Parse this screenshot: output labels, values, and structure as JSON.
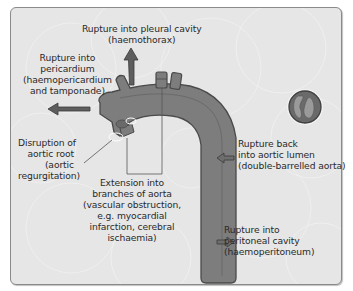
{
  "diagram": {
    "colors": {
      "background": "#e6e6e6",
      "frame_border": "#8a8a8a",
      "aorta_fill": "#7d7d7d",
      "aorta_outline": "#4a4a4a",
      "arrow_fill": "#5e5e5e",
      "text": "#2a2a2a"
    },
    "labels": {
      "pleural": {
        "line1": "Rupture into pleural cavity",
        "line2": "(haemothorax)"
      },
      "pericardium": {
        "line1": "Rupture into",
        "line2": "pericardium",
        "line3": "(haemopericardium",
        "line4": "and tamponade)"
      },
      "aortic_root": {
        "line1": "Disruption of",
        "line2": "aortic root",
        "line3": "(aortic",
        "line4": "regurgitation)"
      },
      "branches": {
        "line1": "Extension into",
        "line2": "branches of aorta",
        "line3": "(vascular obstruction,",
        "line4": "e.g. myocardial",
        "line5": "infarction, cerebral",
        "line6": "ischaemia)"
      },
      "rupture_back": {
        "line1": "Rupture back",
        "line2": "into aortic lumen",
        "line3": "(double-barrelled aorta)"
      },
      "peritoneal": {
        "line1": "Rupture into",
        "line2": "peritoneal cavity",
        "line3": "(haemoperitoneum)"
      }
    },
    "icons": {
      "aorta": "aortic-arch-illustration",
      "cross_section": "double-barrelled-lumen-cross-section",
      "arrows": [
        "arrow-up-pleural",
        "arrow-left-pericardium",
        "arrow-left-lumen",
        "arrow-right-peritoneal"
      ]
    }
  }
}
